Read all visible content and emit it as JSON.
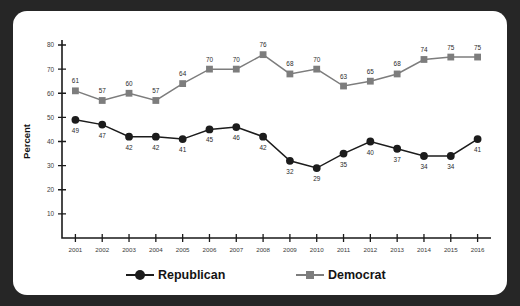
{
  "chart_data": {
    "type": "line",
    "title": "",
    "xlabel": "",
    "ylabel": "Percent",
    "ylim": [
      0,
      80
    ],
    "yticks": [
      10,
      20,
      30,
      40,
      50,
      60,
      70,
      80
    ],
    "grid": false,
    "legend_position": "bottom",
    "categories": [
      "2001",
      "2002",
      "2003",
      "2004",
      "2005",
      "2006",
      "2007",
      "2008",
      "2009",
      "2010",
      "2011",
      "2012",
      "2013",
      "2014",
      "2015",
      "2016"
    ],
    "series": [
      {
        "name": "Republican",
        "marker": "circle",
        "color": "#1c1c1c",
        "values": [
          49,
          47,
          42,
          42,
          41,
          45,
          46,
          42,
          32,
          29,
          35,
          40,
          37,
          34,
          34,
          41
        ],
        "label_position": [
          "below",
          "below",
          "below",
          "below",
          "below",
          "below",
          "below",
          "below",
          "below",
          "below",
          "below",
          "below",
          "below",
          "below",
          "below",
          "below"
        ]
      },
      {
        "name": "Democrat",
        "marker": "square",
        "color": "#7d7d7d",
        "values": [
          61,
          57,
          60,
          57,
          64,
          70,
          70,
          76,
          68,
          70,
          63,
          65,
          68,
          74,
          75,
          75
        ],
        "label_position": [
          "above",
          "above",
          "above",
          "above",
          "above",
          "above",
          "above",
          "above",
          "above",
          "above",
          "above",
          "above",
          "above",
          "above",
          "above",
          "above"
        ]
      }
    ]
  },
  "legend": {
    "items": [
      {
        "label": "Republican",
        "color": "#1c1c1c",
        "marker": "circle"
      },
      {
        "label": "Democrat",
        "color": "#7d7d7d",
        "marker": "square"
      }
    ]
  },
  "colors": {
    "frame": "#262626",
    "panel": "#ffffff",
    "republican": "#1c1c1c",
    "democrat": "#7d7d7d",
    "axis": "#1a1a1a"
  }
}
